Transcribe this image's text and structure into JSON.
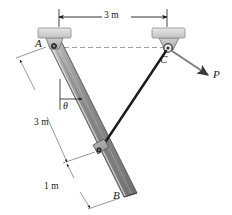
{
  "figure": {
    "labels": {
      "point_a": "A",
      "point_b": "B",
      "point_c": "C",
      "force": "P",
      "angle": "θ"
    },
    "dimensions": {
      "span_ac": "3 m",
      "rod_upper": "3 m",
      "rod_lower": "1 m"
    },
    "colors": {
      "line": "#1a1a1a",
      "rod_fill": "#8c8c8c",
      "rod_edge_light": "#d9d9d9",
      "rod_edge_dark": "#5c5c5c",
      "support_block": "#d4d4d4",
      "bracket": "#bfbfbf",
      "dashed": "#a8a8a8",
      "force_arrow": "#7a7a7a"
    },
    "geometry": {
      "a_x": 52,
      "a_y": 47,
      "b_x": 125,
      "b_y": 192,
      "c_x": 168,
      "c_y": 48,
      "link_pin_x": 100,
      "link_pin_y": 150,
      "p_tip_x": 209,
      "p_tip_y": 76
    }
  }
}
